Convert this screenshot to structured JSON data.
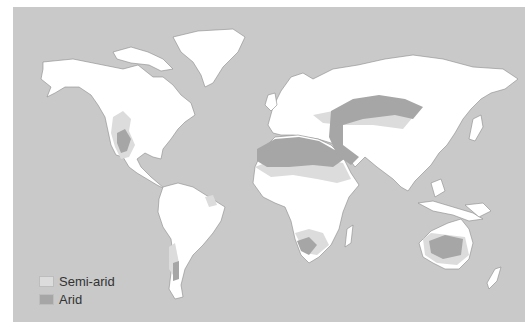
{
  "map": {
    "title": "World arid and semi-arid regions",
    "colors": {
      "ocean": "#c9c9c9",
      "land": "#ffffff",
      "semi_arid": "#dcdcdc",
      "arid": "#a6a6a6"
    }
  },
  "legend": {
    "items": [
      {
        "label": "Semi-arid",
        "color": "#dcdcdc"
      },
      {
        "label": "Arid",
        "color": "#a6a6a6"
      }
    ]
  }
}
